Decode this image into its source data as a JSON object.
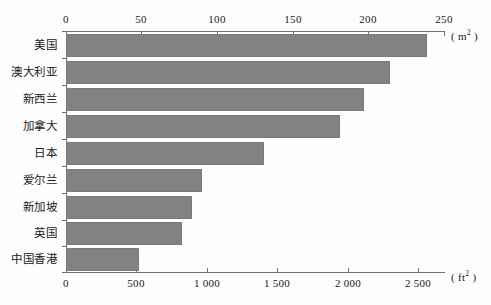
{
  "chart_data": {
    "type": "bar",
    "orientation": "horizontal",
    "title": "",
    "xlabel": "",
    "ylabel": "",
    "categories": [
      "美国",
      "澳大利亚",
      "新西兰",
      "加拿大",
      "日本",
      "爱尔兰",
      "新加坡",
      "英国",
      "中国香港"
    ],
    "values": [
      239,
      214,
      197,
      181,
      131,
      90,
      83,
      77,
      48
    ],
    "grid": false,
    "legend": null,
    "axes": {
      "top": {
        "unit": "m",
        "unit_sup": "2",
        "unit_label": "( m2 )",
        "ticks": [
          0,
          50,
          100,
          150,
          200,
          250
        ],
        "tick_labels": [
          "0",
          "50",
          "100",
          "150",
          "200",
          "250"
        ],
        "range": [
          0,
          250
        ]
      },
      "bottom": {
        "unit": "ft",
        "unit_sup": "2",
        "unit_label": "( ft2 )",
        "ticks": [
          0,
          500,
          1000,
          1500,
          2000,
          2500
        ],
        "tick_labels": [
          "0",
          "500",
          "1 000",
          "1 500",
          "2 000",
          "2 500"
        ],
        "range": [
          0,
          2691
        ]
      }
    },
    "colors": {
      "bar_fill": "#828282",
      "bar_stroke": "#7a7a7a",
      "axis": "#6f6f6f",
      "text": "#1a1a1a",
      "background": "#fdfdfd"
    }
  }
}
